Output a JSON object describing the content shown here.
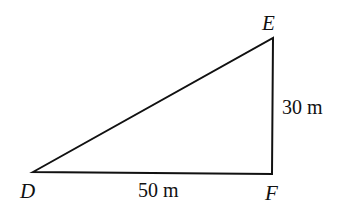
{
  "diagram": {
    "type": "right-triangle",
    "vertices": {
      "D": {
        "label": "D"
      },
      "E": {
        "label": "E"
      },
      "F": {
        "label": "F"
      }
    },
    "sides": {
      "DF": {
        "label": "50 m"
      },
      "EF": {
        "label": "30 m"
      }
    },
    "right_angle_at": "F",
    "stroke_color": "#111111",
    "background_color": "#ffffff"
  }
}
